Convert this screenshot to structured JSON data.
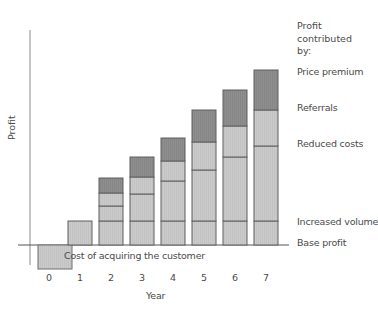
{
  "chart_data": {
    "type": "bar",
    "stacked": true,
    "title": "",
    "xlabel": "Year",
    "ylabel": "Profit",
    "categories": [
      "0",
      "1",
      "2",
      "3",
      "4",
      "5",
      "6",
      "7"
    ],
    "series": [
      {
        "name": "Base profit",
        "color": "#c8c8c8",
        "values": [
          0,
          24,
          24,
          24,
          24,
          24,
          24,
          24
        ]
      },
      {
        "name": "Increased volume",
        "color": "#cdcdcd",
        "values": [
          0,
          0,
          15,
          27,
          40,
          51,
          64,
          75
        ]
      },
      {
        "name": "Reduced costs",
        "color": "#d0d0d0",
        "values": [
          0,
          0,
          13,
          17,
          20,
          28,
          31,
          36
        ]
      },
      {
        "name": "Referrals",
        "color": "#d4d4d4",
        "values": [
          0,
          0,
          0,
          0,
          0,
          0,
          0,
          0
        ]
      },
      {
        "name": "Price premium",
        "color": "#8e8e8e",
        "values": [
          0,
          0,
          15,
          20,
          23,
          32,
          36,
          40
        ]
      },
      {
        "name": "Cost of acquiring the customer",
        "color": "#c8c8c8",
        "values": [
          -24,
          0,
          0,
          0,
          0,
          0,
          0,
          0
        ]
      }
    ],
    "segments_px": [
      {
        "year": 0,
        "bottom": 245,
        "top": 269
      },
      {
        "year": 1,
        "bounds": [
          245,
          221
        ]
      },
      {
        "year": 2,
        "bounds": [
          245,
          221,
          206,
          193,
          178
        ]
      },
      {
        "year": 3,
        "bounds": [
          245,
          221,
          194,
          177,
          157
        ]
      },
      {
        "year": 4,
        "bounds": [
          245,
          221,
          181,
          161,
          138
        ]
      },
      {
        "year": 5,
        "bounds": [
          245,
          221,
          170,
          142,
          110
        ]
      },
      {
        "year": 6,
        "bounds": [
          245,
          221,
          157,
          126,
          90
        ]
      },
      {
        "year": 7,
        "bounds": [
          245,
          221,
          146,
          110,
          70
        ]
      }
    ],
    "legend_position": "right",
    "grid": false,
    "annotations": [
      "Cost of acquiring the customer"
    ]
  },
  "legend": {
    "title": "Profit\ncontributed\nby:",
    "items": [
      "Price premium",
      "Referrals",
      "Reduced costs",
      "Increased volume",
      "Base profit"
    ]
  },
  "axis": {
    "xlabel": "Year",
    "ylabel": "Profit",
    "ticks": [
      "0",
      "1",
      "2",
      "3",
      "4",
      "5",
      "6",
      "7"
    ]
  },
  "annotation": "Cost of acquiring the customer"
}
